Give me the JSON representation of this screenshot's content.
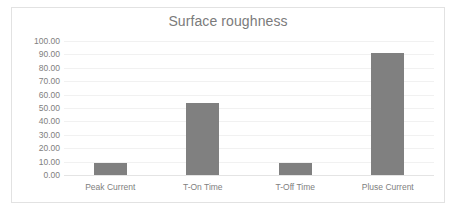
{
  "chart_data": {
    "type": "bar",
    "title": "Surface roughness",
    "xlabel": "",
    "ylabel": "",
    "categories": [
      "Peak Current",
      "T-On Time",
      "T-Off Time",
      "Pluse Current"
    ],
    "values": [
      9.0,
      54.0,
      9.0,
      91.0
    ],
    "ylim": [
      0,
      100
    ],
    "ytick_step": 10,
    "ytick_labels": [
      "100.00",
      "90.00",
      "80.00",
      "70.00",
      "60.00",
      "50.00",
      "40.00",
      "30.00",
      "20.00",
      "10.00",
      "0.00"
    ],
    "ytick_values": [
      100,
      90,
      80,
      70,
      60,
      50,
      40,
      30,
      20,
      10,
      0
    ],
    "grid": true,
    "grid_axis": "y",
    "legend": false,
    "legend_position": "none",
    "series": [
      {
        "name": "Surface roughness",
        "values": [
          9.0,
          54.0,
          9.0,
          91.0
        ],
        "color": "#808080"
      }
    ]
  },
  "colors": {
    "bar": "#808080",
    "title_text": "#7b7b7b",
    "tick_text": "#808080",
    "gridline": "#f1f1f1",
    "baseline": "#e4e4e4",
    "border": "#e2e2e2",
    "background": "#ffffff"
  }
}
